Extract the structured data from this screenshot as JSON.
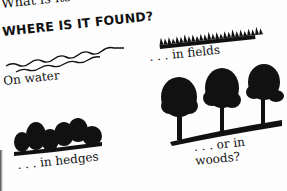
{
  "page": {
    "top_text": "What is its ca",
    "heading": "WHERE IS IT FOUND?",
    "captions": {
      "water": "On water",
      "fields": ". . . in fields",
      "hedges": ". . . in hedges",
      "woods": ". . . or in woods?"
    },
    "illustrations": [
      "water-waves",
      "grass-strip",
      "hedge-silhouette",
      "trees-silhouette"
    ],
    "colors": {
      "ink": "#111111",
      "paper": "#fdfdfd"
    }
  }
}
